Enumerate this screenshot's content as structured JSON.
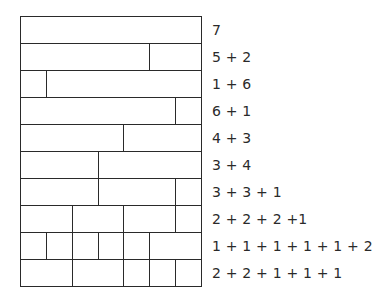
{
  "diagram": {
    "total_units": 7,
    "rows": [
      {
        "label": "7",
        "parts": [
          7
        ]
      },
      {
        "label": "5 + 2",
        "parts": [
          5,
          2
        ]
      },
      {
        "label": "1 + 6",
        "parts": [
          1,
          6
        ]
      },
      {
        "label": "6 + 1",
        "parts": [
          6,
          1
        ]
      },
      {
        "label": "4 + 3",
        "parts": [
          4,
          3
        ]
      },
      {
        "label": "3 + 4",
        "parts": [
          3,
          4
        ]
      },
      {
        "label": "3 + 3 + 1",
        "parts": [
          3,
          3,
          1
        ]
      },
      {
        "label": "2 + 2 + 2 +1",
        "parts": [
          2,
          2,
          2,
          1
        ]
      },
      {
        "label": "1 + 1 + 1 + 1 + 1 + 2",
        "parts": [
          1,
          1,
          1,
          1,
          1,
          2
        ]
      },
      {
        "label": "2 + 2 + 1 + 1 + 1",
        "parts": [
          2,
          2,
          1,
          1,
          1
        ]
      }
    ]
  },
  "colors": {
    "line": "#2a2a2a",
    "background": "#ffffff",
    "text": "#2a2a2a"
  }
}
